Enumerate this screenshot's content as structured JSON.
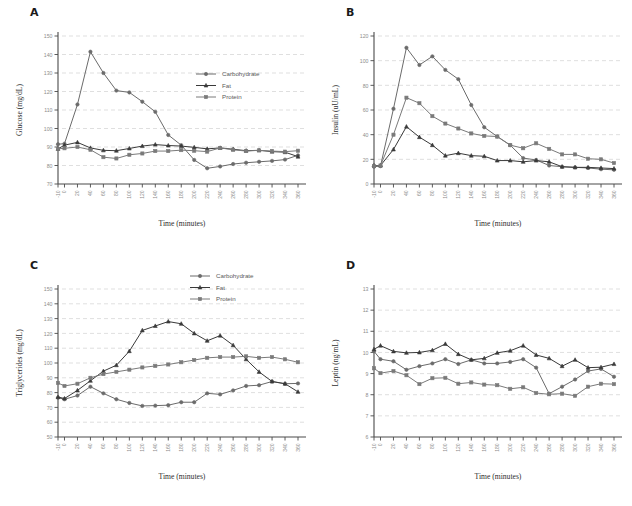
{
  "figure": {
    "panels": [
      "A",
      "B",
      "C",
      "D"
    ]
  },
  "common": {
    "xlabel": "Time (minutes)",
    "legend": [
      {
        "label": "Carbohydrate",
        "marker": "circle-marker",
        "color": "#6b6b6b"
      },
      {
        "label": "Fat",
        "marker": "triangle-marker",
        "color": "#3a3a3a"
      },
      {
        "label": "Protein",
        "marker": "square-marker",
        "color": "#7a7a7a"
      }
    ],
    "x": [
      -10,
      0,
      20,
      40,
      60,
      80,
      100,
      120,
      140,
      160,
      180,
      200,
      220,
      240,
      260,
      280,
      300,
      320,
      340,
      360
    ],
    "xticklabels": [
      "-10",
      "0",
      "20",
      "40",
      "60",
      "80",
      "100",
      "120",
      "140",
      "160",
      "180",
      "200",
      "220",
      "240",
      "260",
      "280",
      "300",
      "320",
      "340",
      "360"
    ]
  },
  "chart_data": [
    {
      "panel": "A",
      "type": "line",
      "title": "",
      "xlabel": "Time (minutes)",
      "ylabel": "Glucose (mg/dL)",
      "ylim": [
        70,
        150
      ],
      "yticks": [
        70,
        80,
        90,
        100,
        110,
        120,
        130,
        140,
        150
      ],
      "yticklabels": [
        "70",
        "80",
        "90",
        "100",
        "110",
        "120",
        "130",
        "140",
        "150"
      ],
      "grid": true,
      "legend_position": "upper-right",
      "x": [
        -10,
        0,
        20,
        40,
        60,
        80,
        100,
        120,
        140,
        160,
        180,
        200,
        220,
        240,
        260,
        280,
        300,
        320,
        340,
        360
      ],
      "series": [
        {
          "name": "Carbohydrate",
          "values": [
            91.5,
            91.8,
            113.0,
            141.5,
            130.0,
            120.5,
            119.5,
            114.5,
            109.0,
            96.5,
            91.0,
            83.0,
            78.5,
            79.5,
            80.8,
            81.5,
            82.0,
            82.5,
            83.2,
            85.5
          ]
        },
        {
          "name": "Fat",
          "values": [
            89.0,
            91.0,
            92.5,
            89.5,
            88.2,
            88.0,
            89.2,
            90.5,
            91.3,
            90.8,
            90.5,
            89.8,
            89.0,
            89.5,
            88.8,
            88.0,
            88.2,
            87.5,
            87.2,
            84.8
          ]
        },
        {
          "name": "Protein",
          "values": [
            89.0,
            89.3,
            90.0,
            88.5,
            84.5,
            83.8,
            85.8,
            86.5,
            87.8,
            87.8,
            88.3,
            88.0,
            87.5,
            89.5,
            88.5,
            87.8,
            88.2,
            87.8,
            87.5,
            88.0
          ]
        }
      ]
    },
    {
      "panel": "B",
      "type": "line",
      "title": "",
      "xlabel": "Time (minutes)",
      "ylabel": "Insulin (uU/mL)",
      "ylim": [
        0,
        120
      ],
      "yticks": [
        0,
        20,
        40,
        60,
        80,
        100,
        120
      ],
      "yticklabels": [
        "0",
        "20",
        "40",
        "60",
        "80",
        "100",
        "120"
      ],
      "grid": true,
      "legend_position": "upper-right",
      "x": [
        -10,
        0,
        20,
        40,
        60,
        80,
        100,
        120,
        140,
        160,
        180,
        200,
        220,
        240,
        260,
        280,
        300,
        320,
        340,
        360
      ],
      "series": [
        {
          "name": "Carbohydrate",
          "values": [
            14.0,
            14.5,
            61.0,
            110.5,
            96.5,
            103.5,
            92.5,
            85.0,
            64.0,
            46.0,
            38.5,
            31.5,
            21.0,
            19.5,
            15.0,
            14.0,
            13.5,
            13.0,
            12.0,
            11.5
          ]
        },
        {
          "name": "Fat",
          "values": [
            15.0,
            15.0,
            28.0,
            46.5,
            38.0,
            31.5,
            23.0,
            25.0,
            23.0,
            22.5,
            19.0,
            19.0,
            18.0,
            19.0,
            18.0,
            14.0,
            13.5,
            13.5,
            13.0,
            12.5
          ]
        },
        {
          "name": "Protein",
          "values": [
            14.5,
            15.0,
            40.0,
            70.0,
            65.5,
            55.0,
            49.0,
            45.0,
            41.0,
            39.0,
            38.5,
            31.5,
            29.0,
            33.0,
            28.5,
            24.0,
            24.0,
            20.5,
            20.0,
            17.0
          ]
        }
      ]
    },
    {
      "panel": "C",
      "type": "line",
      "title": "",
      "xlabel": "Time (minutes)",
      "ylabel": "Triglycerides (mg/dL)",
      "ylim": [
        50,
        150
      ],
      "yticks": [
        50,
        60,
        70,
        80,
        90,
        100,
        110,
        120,
        130,
        140,
        150
      ],
      "yticklabels": [
        "50",
        "60",
        "70",
        "80",
        "90",
        "100",
        "110",
        "120",
        "130",
        "140",
        "150"
      ],
      "grid": true,
      "legend_position": "upper-right",
      "x": [
        -10,
        0,
        20,
        40,
        60,
        80,
        100,
        120,
        140,
        160,
        180,
        200,
        220,
        240,
        260,
        280,
        300,
        320,
        340,
        360
      ],
      "series": [
        {
          "name": "Carbohydrate",
          "values": [
            76.5,
            75.5,
            78.0,
            84.0,
            79.5,
            75.5,
            73.0,
            71.0,
            71.2,
            71.5,
            73.5,
            73.5,
            79.5,
            78.8,
            81.5,
            84.5,
            85.0,
            87.5,
            86.0,
            86.2
          ]
        },
        {
          "name": "Fat",
          "values": [
            77.0,
            76.0,
            81.5,
            88.0,
            94.5,
            98.5,
            108.0,
            122.0,
            125.0,
            128.0,
            126.5,
            120.0,
            115.0,
            118.5,
            112.0,
            102.5,
            94.0,
            87.5,
            86.0,
            80.5
          ]
        },
        {
          "name": "Protein",
          "values": [
            86.5,
            84.5,
            86.0,
            90.0,
            92.5,
            94.0,
            95.5,
            97.0,
            98.0,
            99.0,
            100.5,
            102.0,
            103.5,
            104.0,
            104.0,
            104.5,
            103.5,
            104.0,
            102.5,
            100.5
          ]
        }
      ]
    },
    {
      "panel": "D",
      "type": "line",
      "title": "",
      "xlabel": "Time (minutes)",
      "ylabel": "Leptin (ng/mL)",
      "ylim": [
        6,
        13
      ],
      "yticks": [
        6,
        7,
        8,
        9,
        10,
        11,
        12,
        13
      ],
      "yticklabels": [
        "6",
        "7",
        "8",
        "9",
        "10",
        "11",
        "12",
        "13"
      ],
      "grid": true,
      "legend_position": "upper-right",
      "x": [
        -10,
        0,
        20,
        40,
        60,
        80,
        100,
        120,
        140,
        160,
        180,
        200,
        220,
        240,
        260,
        280,
        300,
        320,
        340,
        360
      ],
      "series": [
        {
          "name": "Carbohydrate",
          "values": [
            10.05,
            9.68,
            9.58,
            9.18,
            9.35,
            9.48,
            9.68,
            9.45,
            9.65,
            9.48,
            9.48,
            9.55,
            9.68,
            9.28,
            8.05,
            8.38,
            8.72,
            9.12,
            9.22,
            8.85
          ]
        },
        {
          "name": "Fat",
          "values": [
            10.15,
            10.32,
            10.05,
            9.98,
            10.0,
            10.1,
            10.4,
            9.92,
            9.65,
            9.72,
            9.98,
            10.08,
            10.32,
            9.88,
            9.72,
            9.35,
            9.65,
            9.28,
            9.3,
            9.45
          ]
        },
        {
          "name": "Protein",
          "values": [
            9.25,
            9.02,
            9.12,
            8.92,
            8.5,
            8.78,
            8.8,
            8.52,
            8.58,
            8.48,
            8.45,
            8.28,
            8.35,
            8.08,
            8.02,
            8.05,
            7.95,
            8.38,
            8.52,
            8.5,
            8.42
          ]
        }
      ]
    }
  ]
}
